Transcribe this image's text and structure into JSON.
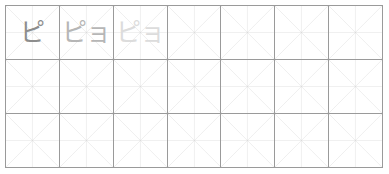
{
  "worksheet": {
    "title": "Katakana handwriting practice grid",
    "script": "katakana",
    "background_color": "#ffffff",
    "border_color": "#9a9a9a",
    "guide_color": "#d8d8d8",
    "center_guide_color": "#cfcfcf"
  },
  "grid": {
    "columns": 7,
    "rows": 3,
    "cell_guides": "x-diagonals-and-center-crosshair"
  },
  "tones": {
    "model": "#8d8d8d",
    "mid": "#b6b6b6",
    "faint": "#dcdcdc"
  },
  "cells": [
    {
      "row": 1,
      "col": 1,
      "text": "ピ",
      "reading": "pi",
      "tone": "model",
      "filled": true
    },
    {
      "row": 1,
      "col": 2,
      "text": "ピョ",
      "reading": "pyo",
      "tone": "mid",
      "filled": true
    },
    {
      "row": 1,
      "col": 3,
      "text": "ピョ",
      "reading": "pyo",
      "tone": "faint",
      "filled": true
    },
    {
      "row": 1,
      "col": 4,
      "text": "",
      "reading": "",
      "tone": "empty",
      "filled": false
    },
    {
      "row": 1,
      "col": 5,
      "text": "",
      "reading": "",
      "tone": "empty",
      "filled": false
    },
    {
      "row": 1,
      "col": 6,
      "text": "",
      "reading": "",
      "tone": "empty",
      "filled": false
    },
    {
      "row": 1,
      "col": 7,
      "text": "",
      "reading": "",
      "tone": "empty",
      "filled": false
    },
    {
      "row": 2,
      "col": 1,
      "text": "",
      "reading": "",
      "tone": "empty",
      "filled": false
    },
    {
      "row": 2,
      "col": 2,
      "text": "",
      "reading": "",
      "tone": "empty",
      "filled": false
    },
    {
      "row": 2,
      "col": 3,
      "text": "",
      "reading": "",
      "tone": "empty",
      "filled": false
    },
    {
      "row": 2,
      "col": 4,
      "text": "",
      "reading": "",
      "tone": "empty",
      "filled": false
    },
    {
      "row": 2,
      "col": 5,
      "text": "",
      "reading": "",
      "tone": "empty",
      "filled": false
    },
    {
      "row": 2,
      "col": 6,
      "text": "",
      "reading": "",
      "tone": "empty",
      "filled": false
    },
    {
      "row": 2,
      "col": 7,
      "text": "",
      "reading": "",
      "tone": "empty",
      "filled": false
    },
    {
      "row": 3,
      "col": 1,
      "text": "",
      "reading": "",
      "tone": "empty",
      "filled": false
    },
    {
      "row": 3,
      "col": 2,
      "text": "",
      "reading": "",
      "tone": "empty",
      "filled": false
    },
    {
      "row": 3,
      "col": 3,
      "text": "",
      "reading": "",
      "tone": "empty",
      "filled": false
    },
    {
      "row": 3,
      "col": 4,
      "text": "",
      "reading": "",
      "tone": "empty",
      "filled": false
    },
    {
      "row": 3,
      "col": 5,
      "text": "",
      "reading": "",
      "tone": "empty",
      "filled": false
    },
    {
      "row": 3,
      "col": 6,
      "text": "",
      "reading": "",
      "tone": "empty",
      "filled": false
    },
    {
      "row": 3,
      "col": 7,
      "text": "",
      "reading": "",
      "tone": "empty",
      "filled": false
    }
  ]
}
